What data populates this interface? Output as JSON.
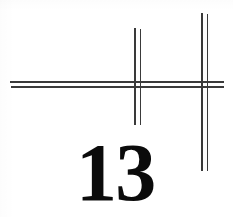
{
  "page": {
    "width": 233,
    "height": 217,
    "background_color": "#ffffff",
    "kind": "scanned-figure"
  },
  "figure": {
    "caption_number": "13",
    "ink_color": "#0b0b0b",
    "rule_color": "#3a3a3a",
    "numeral": {
      "text": "13",
      "left": 76,
      "top": 132,
      "font_size": 82
    },
    "horizontal_rules": [
      {
        "name": "horizontal-rule-upper",
        "left": 10,
        "top": 81,
        "width": 214,
        "weight": "thick"
      },
      {
        "name": "horizontal-rule-lower",
        "left": 11,
        "top": 86,
        "width": 213,
        "weight": "thick"
      }
    ],
    "vertical_rules": [
      {
        "name": "vertical-rule-inner-left",
        "left": 134,
        "top": 28,
        "height": 97,
        "weight": "thick"
      },
      {
        "name": "vertical-rule-inner-right",
        "left": 140,
        "top": 29,
        "height": 96,
        "weight": "thin"
      },
      {
        "name": "vertical-rule-outer-left",
        "left": 201,
        "top": 13,
        "height": 158,
        "weight": "thick"
      },
      {
        "name": "vertical-rule-outer-right",
        "left": 207,
        "top": 14,
        "height": 157,
        "weight": "thin"
      }
    ]
  }
}
